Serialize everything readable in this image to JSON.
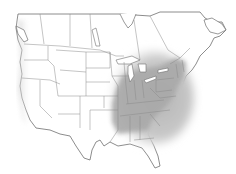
{
  "map": {
    "type": "species-range-map",
    "region": "North America (United States and southern Canada)",
    "colors": {
      "background": "#ffffff",
      "land": "#ffffff",
      "border": "#8a8a8a",
      "coast": "#6f6f6f",
      "range_core": "#a9a9a9",
      "range_fade": "#d6d6d6",
      "coast_shadow": "#d9d9d9"
    },
    "range": {
      "description": "Shaded range covering eastern United States and southeastern Canada",
      "core_states": [
        "Ohio",
        "Indiana",
        "Kentucky",
        "Tennessee",
        "West Virginia",
        "Virginia",
        "North Carolina",
        "South Carolina",
        "Georgia",
        "Alabama",
        "Mississippi",
        "Pennsylvania",
        "New York",
        "New Jersey",
        "Maryland",
        "Delaware",
        "Michigan",
        "Illinois",
        "Connecticut",
        "Massachusetts",
        "Vermont",
        "New Hampshire",
        "Maine"
      ],
      "fade_regions": [
        "Missouri",
        "Arkansas",
        "Louisiana",
        "Wisconsin",
        "Minnesota",
        "Ontario",
        "Quebec",
        "Florida (north)",
        "eastern Texas",
        "eastern Oklahoma"
      ]
    }
  }
}
